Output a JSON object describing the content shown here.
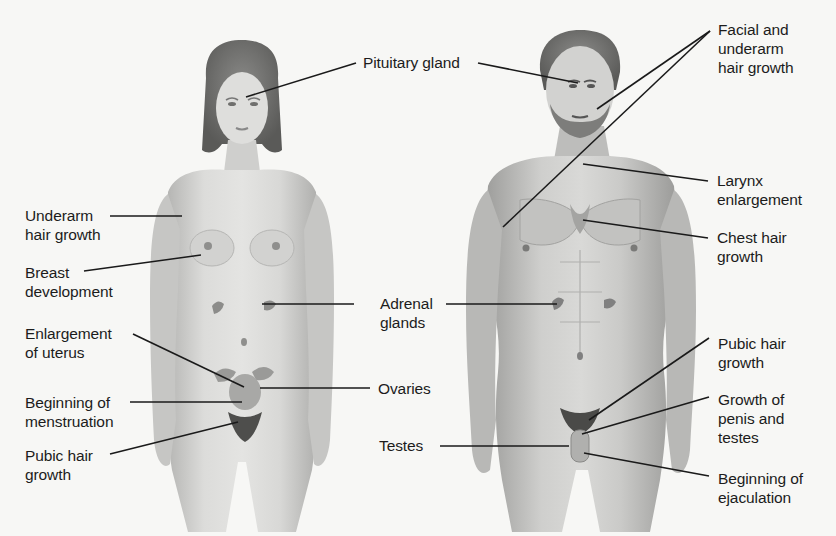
{
  "diagram": {
    "figures": [
      {
        "id": "female",
        "name": "Female figure"
      },
      {
        "id": "male",
        "name": "Male figure"
      }
    ],
    "colors": {
      "background": "#f7f7f5",
      "skin": "#d6d6d4",
      "skin_shadow": "#a9a9a7",
      "hair": "#6a6a68",
      "leader_line": "#1a1a1a",
      "text": "#1c1c1c"
    }
  },
  "labels": {
    "pituitary": {
      "lines": [
        "Pituitary gland"
      ],
      "target": "both"
    },
    "facial_underarm": {
      "lines": [
        "Facial and",
        "underarm",
        "hair growth"
      ],
      "target": "male"
    },
    "larynx": {
      "lines": [
        "Larynx",
        "enlargement"
      ],
      "target": "male"
    },
    "chest_hair": {
      "lines": [
        "Chest hair",
        "growth"
      ],
      "target": "male"
    },
    "underarm": {
      "lines": [
        "Underarm",
        "hair growth"
      ],
      "target": "female"
    },
    "breast": {
      "lines": [
        "Breast",
        "development"
      ],
      "target": "female"
    },
    "adrenal": {
      "lines": [
        "Adrenal",
        "glands"
      ],
      "target": "both"
    },
    "uterus": {
      "lines": [
        "Enlargement",
        "of uterus"
      ],
      "target": "female"
    },
    "ovaries": {
      "lines": [
        "Ovaries"
      ],
      "target": "female"
    },
    "menstruation": {
      "lines": [
        "Beginning of",
        "menstruation"
      ],
      "target": "female"
    },
    "pubic_female": {
      "lines": [
        "Pubic hair",
        "growth"
      ],
      "target": "female"
    },
    "pubic_male": {
      "lines": [
        "Pubic hair",
        "growth"
      ],
      "target": "male"
    },
    "testes": {
      "lines": [
        "Testes"
      ],
      "target": "male"
    },
    "penis_testes": {
      "lines": [
        "Growth of",
        "penis and",
        "testes"
      ],
      "target": "male"
    },
    "ejaculation": {
      "lines": [
        "Beginning of",
        "ejaculation"
      ],
      "target": "male"
    }
  }
}
